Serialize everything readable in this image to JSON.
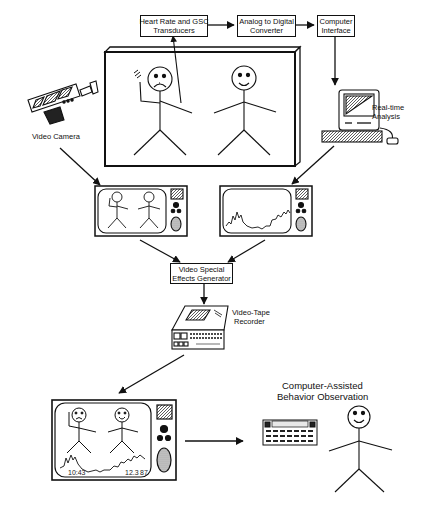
{
  "diagram": {
    "boxes": {
      "transducers": {
        "line1": "Heart Rate and GSC",
        "line2": "Transducers"
      },
      "adc": {
        "line1": "Analog to Digital",
        "line2": "Converter"
      },
      "interface": {
        "line1": "Computer",
        "line2": "Interface"
      },
      "effects": {
        "line1": "Video Special",
        "line2": "Effects Generator"
      }
    },
    "labels": {
      "video_camera": "Video Camera",
      "realtime_1": "Real-time",
      "realtime_2": "Analysis",
      "vtr_1": "Video-Tape",
      "vtr_2": "Recorder",
      "cabo_1": "Computer-Assisted",
      "cabo_2": "Behavior Observation"
    },
    "final_monitor": {
      "time": "10:43",
      "value_1": "12.3",
      "value_2": "87"
    },
    "colors": {
      "ink": "#111111",
      "background": "#ffffff",
      "screen_fill": "#e8e8e8"
    }
  }
}
